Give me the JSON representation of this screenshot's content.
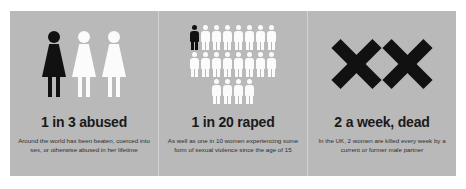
{
  "card": {
    "background_color": "#b9b9b9",
    "divider_color": "#d2d2d2"
  },
  "panels": [
    {
      "id": "abused",
      "icon": "three-women-icon",
      "headline": "1 in 3 abused",
      "caption": "Around the world has been beaten, coerced into sex, or otherwise abused in her lifetime",
      "figures": {
        "total": 3,
        "highlighted": 1,
        "highlight_color": "#111111",
        "base_color": "#fbfbfb"
      }
    },
    {
      "id": "raped",
      "icon": "twenty-people-icon",
      "headline": "1 in 20 raped",
      "caption": "As well as one in 10 women experiencing some form of sexual violence since the age of 15",
      "figures": {
        "total": 20,
        "highlighted": 1,
        "rows": [
          8,
          8,
          4
        ],
        "highlight_color": "#111111",
        "base_color": "#fbfbfb"
      }
    },
    {
      "id": "dead",
      "icon": "double-x-icon",
      "headline": "2 a week, dead",
      "caption": "In the UK, 2 women are killed every week by a current or former male partner",
      "figures": {
        "total": 2,
        "highlighted": 2,
        "highlight_color": "#111111"
      }
    }
  ]
}
